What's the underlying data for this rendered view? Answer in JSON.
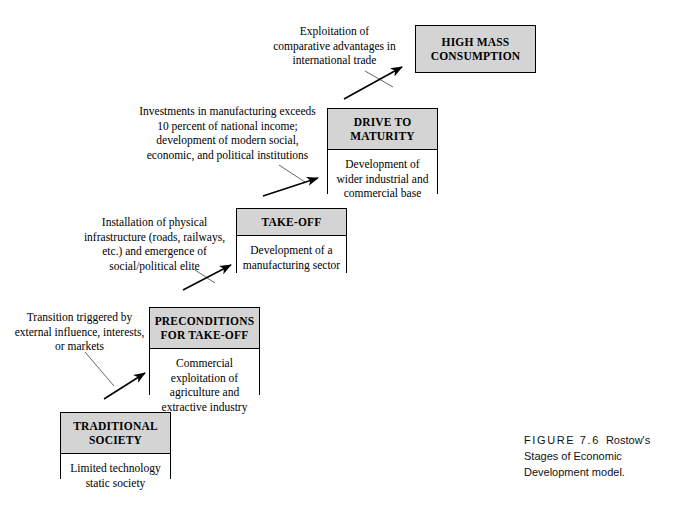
{
  "figure": {
    "label": "FIGURE 7.6",
    "title_line1": "Rostow's",
    "title_line2": "Stages of Economic",
    "title_line3": "Development model."
  },
  "colors": {
    "header_fill": "#d4d4d4",
    "body_fill": "#ffffff",
    "stroke": "#000000",
    "text": "#000000"
  },
  "stages": [
    {
      "id": "high-mass-consumption",
      "header": "HIGH MASS\nCONSUMPTION",
      "header_line1": "HIGH MASS",
      "header_line2": "CONSUMPTION",
      "body": "",
      "order": 5
    },
    {
      "id": "drive-to-maturity",
      "header_line1": "DRIVE TO",
      "header_line2": "MATURITY",
      "body": "Development of wider industrial and commercial base",
      "order": 4
    },
    {
      "id": "take-off",
      "header_line1": "TAKE-OFF",
      "header_line2": "",
      "body": "Development of a manufacturing sector",
      "order": 3
    },
    {
      "id": "preconditions-for-take-off",
      "header_line1": "PRECONDITIONS",
      "header_line2": "FOR TAKE-OFF",
      "body": "Commercial exploitation of agriculture and extractive industry",
      "order": 2
    },
    {
      "id": "traditional-society",
      "header_line1": "TRADITIONAL",
      "header_line2": "SOCIETY",
      "body": "Limited technology static society",
      "order": 1
    }
  ],
  "annotations": [
    {
      "id": "annotation-high-mass-consumption",
      "text": "Exploitation of comparative advantages in international trade"
    },
    {
      "id": "annotation-drive-to-maturity",
      "text": "Investments in manufacturing exceeds 10 percent of national income; development of modern social, economic, and political institutions"
    },
    {
      "id": "annotation-take-off",
      "text": "Installation of physical infrastructure (roads, railways, etc.) and emergence of social/political elite"
    },
    {
      "id": "annotation-preconditions",
      "text": "Transition triggered by external influence, interests, or markets"
    }
  ]
}
